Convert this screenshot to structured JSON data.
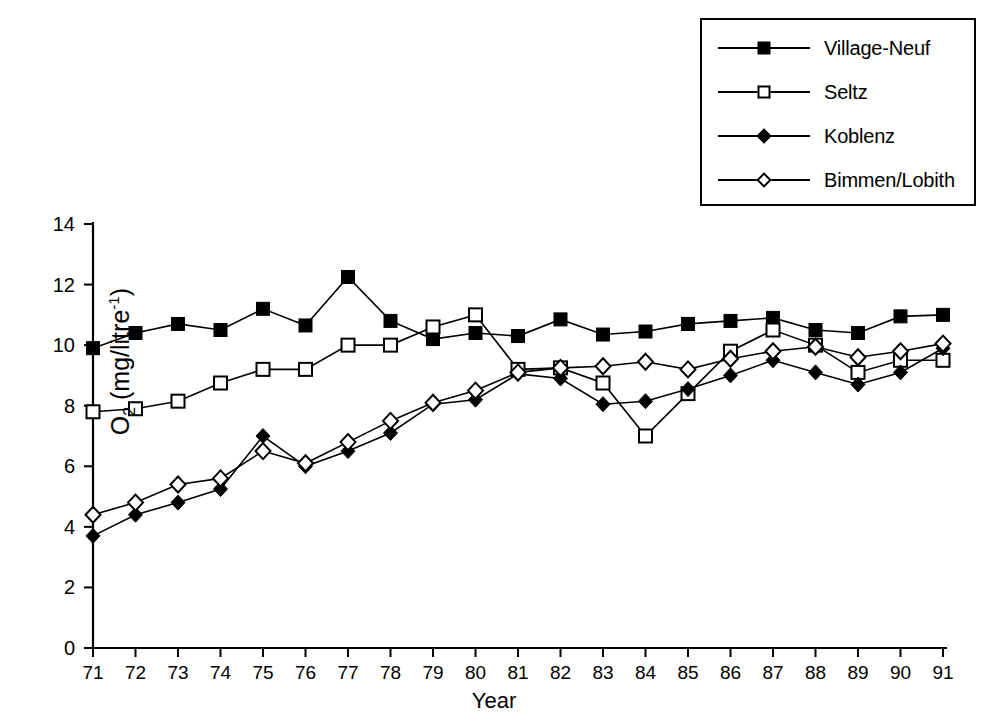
{
  "chart_data": {
    "type": "line",
    "title": "",
    "xlabel": "Year",
    "ylabel": "O2 (mg/litre-1)",
    "ylabel_parts": {
      "base": "O",
      "sub": "2",
      "unit_open": " (mg/litre",
      "sup": "-1",
      "unit_close": ")"
    },
    "x": [
      71,
      72,
      73,
      74,
      75,
      76,
      77,
      78,
      79,
      80,
      81,
      82,
      83,
      84,
      85,
      86,
      87,
      88,
      89,
      90,
      91
    ],
    "xtick_labels": [
      "71",
      "72",
      "73",
      "74",
      "75",
      "76",
      "77",
      "78",
      "79",
      "80",
      "81",
      "82",
      "83",
      "84",
      "85",
      "86",
      "87",
      "88",
      "89",
      "90",
      "91"
    ],
    "ytick_labels": [
      "0",
      "2",
      "4",
      "6",
      "8",
      "10",
      "12",
      "14"
    ],
    "yticks": [
      0,
      2,
      4,
      6,
      8,
      10,
      12,
      14
    ],
    "xlim": [
      71,
      91
    ],
    "ylim": [
      0,
      14
    ],
    "grid": false,
    "legend_position": "top-right",
    "series": [
      {
        "name": "Village-Neuf",
        "marker": "filled-square",
        "values": [
          9.9,
          10.4,
          10.7,
          10.5,
          11.2,
          10.65,
          12.25,
          10.8,
          10.2,
          10.4,
          10.3,
          10.85,
          10.35,
          10.45,
          10.7,
          10.8,
          10.9,
          10.5,
          10.4,
          10.95,
          11.0
        ]
      },
      {
        "name": "Seltz",
        "marker": "open-square",
        "values": [
          7.8,
          7.9,
          8.15,
          8.75,
          9.2,
          9.2,
          10.0,
          10.0,
          10.6,
          11.0,
          9.2,
          9.25,
          8.75,
          7.0,
          8.4,
          9.8,
          10.5,
          10.0,
          9.1,
          9.5,
          9.5
        ]
      },
      {
        "name": "Koblenz",
        "marker": "filled-diamond",
        "values": [
          3.7,
          4.4,
          4.8,
          5.25,
          7.0,
          6.0,
          6.5,
          7.1,
          8.05,
          8.2,
          9.05,
          8.9,
          8.05,
          8.15,
          8.55,
          9.0,
          9.5,
          9.1,
          8.7,
          9.1,
          9.9
        ]
      },
      {
        "name": "Bimmen/Lobith",
        "marker": "open-diamond",
        "values": [
          4.4,
          4.8,
          5.4,
          5.6,
          6.5,
          6.1,
          6.8,
          7.5,
          8.1,
          8.5,
          9.1,
          9.25,
          9.3,
          9.45,
          9.2,
          9.55,
          9.8,
          9.95,
          9.6,
          9.8,
          10.05
        ]
      }
    ]
  },
  "legend": {
    "entries": [
      {
        "label": "Village-Neuf",
        "marker": "filled-square"
      },
      {
        "label": "Seltz",
        "marker": "open-square"
      },
      {
        "label": "Koblenz",
        "marker": "filled-diamond"
      },
      {
        "label": "Bimmen/Lobith",
        "marker": "open-diamond"
      }
    ]
  },
  "colors": {
    "line": "#000000",
    "background": "#ffffff"
  }
}
